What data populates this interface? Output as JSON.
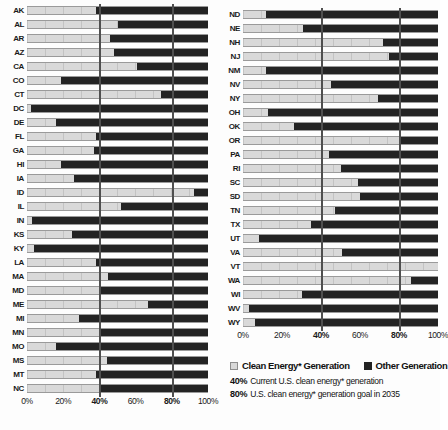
{
  "chart_data": {
    "type": "bar",
    "orientation": "horizontal",
    "stacked": true,
    "title": "",
    "xlabel": "",
    "ylabel": "",
    "xlim": [
      0,
      100
    ],
    "unit": "%",
    "grid": false,
    "x_ticks": [
      {
        "label": "0%",
        "value": 0,
        "bold": false
      },
      {
        "label": "20%",
        "value": 20,
        "bold": false
      },
      {
        "label": "40%",
        "value": 40,
        "bold": true
      },
      {
        "label": "60%",
        "value": 60,
        "bold": false
      },
      {
        "label": "80%",
        "value": 80,
        "bold": true
      },
      {
        "label": "100%",
        "value": 100,
        "bold": false
      }
    ],
    "reference_lines": [
      {
        "value": 40,
        "label": "Current U.S. clean energy* generation"
      },
      {
        "value": 80,
        "label": "U.S. clean energy* generation goal in 2035"
      }
    ],
    "series_names": [
      "Clean Energy* Generation",
      "Other Generation"
    ],
    "panels": [
      {
        "name": "left",
        "states": [
          {
            "label": "AK",
            "clean": 38,
            "other": 62
          },
          {
            "label": "AL",
            "clean": 50,
            "other": 50
          },
          {
            "label": "AR",
            "clean": 46,
            "other": 54
          },
          {
            "label": "AZ",
            "clean": 48,
            "other": 52
          },
          {
            "label": "CA",
            "clean": 61,
            "other": 39
          },
          {
            "label": "CO",
            "clean": 19,
            "other": 81
          },
          {
            "label": "CT",
            "clean": 74,
            "other": 26
          },
          {
            "label": "DC",
            "clean": 2,
            "other": 98
          },
          {
            "label": "DE",
            "clean": 16,
            "other": 84
          },
          {
            "label": "FL",
            "clean": 38,
            "other": 62
          },
          {
            "label": "GA",
            "clean": 37,
            "other": 63
          },
          {
            "label": "HI",
            "clean": 19,
            "other": 81
          },
          {
            "label": "IA",
            "clean": 26,
            "other": 74
          },
          {
            "label": "ID",
            "clean": 92,
            "other": 8
          },
          {
            "label": "IL",
            "clean": 52,
            "other": 48
          },
          {
            "label": "IN",
            "clean": 3,
            "other": 97
          },
          {
            "label": "KS",
            "clean": 25,
            "other": 75
          },
          {
            "label": "KY",
            "clean": 4,
            "other": 96
          },
          {
            "label": "LA",
            "clean": 38,
            "other": 62
          },
          {
            "label": "MA",
            "clean": 45,
            "other": 55
          },
          {
            "label": "MD",
            "clean": 40,
            "other": 60
          },
          {
            "label": "ME",
            "clean": 67,
            "other": 33
          },
          {
            "label": "MI",
            "clean": 29,
            "other": 71
          },
          {
            "label": "MN",
            "clean": 40,
            "other": 60
          },
          {
            "label": "MO",
            "clean": 16,
            "other": 84
          },
          {
            "label": "MS",
            "clean": 44,
            "other": 56
          },
          {
            "label": "MT",
            "clean": 38,
            "other": 62
          },
          {
            "label": "NC",
            "clean": 40,
            "other": 60
          }
        ]
      },
      {
        "name": "right",
        "states": [
          {
            "label": "ND",
            "clean": 12,
            "other": 88
          },
          {
            "label": "NE",
            "clean": 31,
            "other": 69
          },
          {
            "label": "NH",
            "clean": 72,
            "other": 28
          },
          {
            "label": "NJ",
            "clean": 75,
            "other": 25
          },
          {
            "label": "NM",
            "clean": 12,
            "other": 88
          },
          {
            "label": "NV",
            "clean": 45,
            "other": 55
          },
          {
            "label": "NY",
            "clean": 69,
            "other": 31
          },
          {
            "label": "OH",
            "clean": 13,
            "other": 87
          },
          {
            "label": "OK",
            "clean": 26,
            "other": 74
          },
          {
            "label": "OR",
            "clean": 80,
            "other": 20
          },
          {
            "label": "PA",
            "clean": 44,
            "other": 56
          },
          {
            "label": "RI",
            "clean": 50,
            "other": 50
          },
          {
            "label": "SC",
            "clean": 59,
            "other": 41
          },
          {
            "label": "SD",
            "clean": 60,
            "other": 40
          },
          {
            "label": "TN",
            "clean": 47,
            "other": 53
          },
          {
            "label": "TX",
            "clean": 35,
            "other": 65
          },
          {
            "label": "UT",
            "clean": 8,
            "other": 92
          },
          {
            "label": "VA",
            "clean": 51,
            "other": 49
          },
          {
            "label": "VT",
            "clean": 100,
            "other": 0
          },
          {
            "label": "WA",
            "clean": 86,
            "other": 14
          },
          {
            "label": "WI",
            "clean": 30,
            "other": 70
          },
          {
            "label": "WV",
            "clean": 3,
            "other": 97
          },
          {
            "label": "WY",
            "clean": 6,
            "other": 94
          }
        ]
      }
    ]
  },
  "legend": {
    "items": [
      {
        "swatch": "light",
        "label": "Clean Energy* Generation"
      },
      {
        "swatch": "dark",
        "label": "Other Generation"
      }
    ],
    "notes": [
      {
        "value": "40%",
        "text": "Current U.S. clean energy* generation"
      },
      {
        "value": "80%",
        "text": "U.S. clean energy* generation goal in 2035"
      }
    ]
  },
  "colors": {
    "clean": "#d9d9d9",
    "other": "#232323",
    "reference_line": "#4f4f4f",
    "background": "#fdfdfd"
  }
}
